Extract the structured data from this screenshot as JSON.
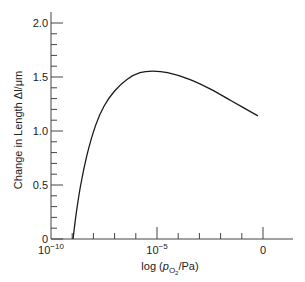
{
  "chart_data": {
    "type": "line",
    "title": "",
    "xlabel": "log (p_O2/Pa)",
    "xlabel_parts": {
      "prefix": "log (",
      "var": "p",
      "sub": "O",
      "subsub": "2",
      "suffix": "/Pa)"
    },
    "ylabel": "Change in Length Δl/μm",
    "xscale": "log",
    "xlim_log10": [
      -10,
      1.4
    ],
    "ylim": [
      0,
      2.1
    ],
    "x_ticks": [
      {
        "value": -10,
        "label": "10",
        "exp": "−10"
      },
      {
        "value": -5,
        "label": "10",
        "exp": "−5"
      },
      {
        "value": 0,
        "label": "0",
        "exp": ""
      }
    ],
    "x_minor_ticks": [
      -9,
      -8,
      -7,
      -6,
      -4,
      -3,
      -2,
      -1
    ],
    "y_ticks": [
      {
        "value": 0,
        "label": "0"
      },
      {
        "value": 0.5,
        "label": "0.5"
      },
      {
        "value": 1.0,
        "label": "1.0"
      },
      {
        "value": 1.5,
        "label": "1.5"
      },
      {
        "value": 2.0,
        "label": "2.0"
      }
    ],
    "y_minor_step": 0.1,
    "grid": false,
    "legend": null,
    "series": [
      {
        "name": "Change in length",
        "x_log10": [
          -8.96,
          -8.9,
          -8.8,
          -8.6,
          -8.3,
          -7.9,
          -7.5,
          -7.0,
          -6.4,
          -5.8,
          -5.2,
          -4.5,
          -3.5,
          -2.5,
          -1.5,
          -0.24
        ],
        "y": [
          0.0,
          0.1,
          0.25,
          0.5,
          0.78,
          1.05,
          1.23,
          1.37,
          1.48,
          1.54,
          1.555,
          1.54,
          1.48,
          1.39,
          1.28,
          1.14
        ]
      }
    ]
  }
}
